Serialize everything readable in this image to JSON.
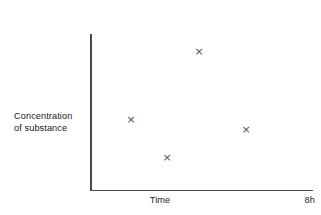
{
  "chart_data": {
    "type": "scatter",
    "title": "",
    "xlabel": "Time",
    "ylabel": "Concentration\nof substance",
    "x_max_label": "8h",
    "xlim": [
      0,
      8
    ],
    "ylim": [
      0,
      1
    ],
    "grid": false,
    "legend": null,
    "marker": "×",
    "marker_color": "#545454",
    "axis_color": "#4a4a4a",
    "background": "#ffffff",
    "tick_labels": {
      "x": [
        "Time",
        "8h"
      ],
      "y": []
    },
    "points": [
      {
        "name": "point-1",
        "x": 1.5,
        "y": 0.45,
        "px": 131,
        "py": 119
      },
      {
        "name": "point-2",
        "x": 2.8,
        "y": 0.21,
        "px": 167,
        "py": 157
      },
      {
        "name": "point-3",
        "x": 3.95,
        "y": 0.89,
        "px": 199,
        "py": 51
      },
      {
        "name": "point-4",
        "x": 5.65,
        "y": 0.39,
        "px": 246,
        "py": 129
      }
    ]
  },
  "labels": {
    "y_axis_title": "Concentration\nof substance",
    "x_axis_title": "Time",
    "x_axis_end": "8h"
  },
  "markers": {
    "glyph": "×"
  }
}
